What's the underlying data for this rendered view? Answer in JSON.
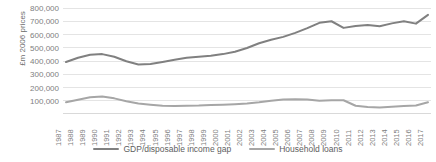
{
  "chart_data": {
    "type": "line",
    "title": "",
    "xlabel": "",
    "ylabel": "£m 2006 prices",
    "ylim": [
      0,
      800000
    ],
    "ytick_labels": [
      "800,000",
      "700,000",
      "600,000",
      "500,000",
      "400,000",
      "300,000",
      "200,000",
      "100,000"
    ],
    "yticks": [
      800000,
      700000,
      600000,
      500000,
      400000,
      300000,
      200000,
      100000
    ],
    "grid": true,
    "grid_color": "#d9d9d9",
    "legend_position": "bottom",
    "categories": [
      "1987",
      "1988",
      "1989",
      "1990",
      "1991",
      "1992",
      "1993",
      "1994",
      "1995",
      "1996",
      "1997",
      "1998",
      "1999",
      "2000",
      "2001",
      "2002",
      "2003",
      "2004",
      "2005",
      "2006",
      "2007",
      "2008",
      "2009",
      "2010",
      "2011",
      "2012",
      "2013",
      "2014",
      "2015",
      "2016",
      "2017"
    ],
    "series": [
      {
        "name": "GDP/disposable income gap",
        "color": "#808080",
        "values": [
          392000,
          425000,
          447000,
          452000,
          432000,
          398000,
          374000,
          378000,
          393000,
          410000,
          424000,
          432000,
          440000,
          452000,
          470000,
          498000,
          534000,
          560000,
          582000,
          612000,
          648000,
          688000,
          700000,
          650000,
          665000,
          672000,
          662000,
          684000,
          700000,
          682000,
          748000
        ]
      },
      {
        "name": "Household loans",
        "color": "#a6a6a6",
        "values": [
          88000,
          108000,
          126000,
          132000,
          118000,
          96000,
          80000,
          70000,
          62000,
          60000,
          62000,
          64000,
          68000,
          70000,
          74000,
          80000,
          88000,
          100000,
          110000,
          112000,
          110000,
          100000,
          104000,
          104000,
          62000,
          52000,
          50000,
          54000,
          60000,
          64000,
          88000
        ]
      }
    ]
  },
  "legend": {
    "items": [
      {
        "label": "GDP/disposable income gap"
      },
      {
        "label": "Household loans"
      }
    ]
  },
  "axis": {
    "y_title": "£m 2006 prices"
  }
}
